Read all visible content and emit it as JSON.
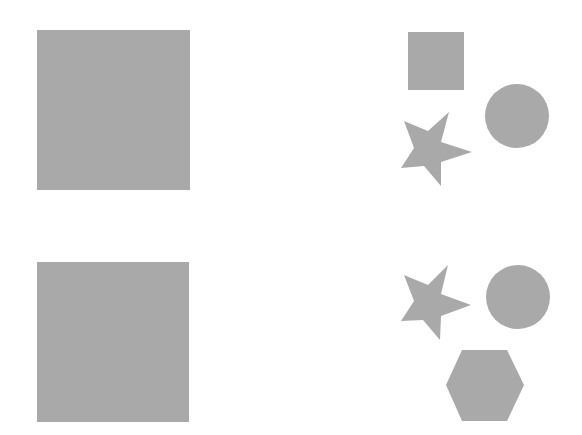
{
  "colors": {
    "background": "#ffffff",
    "fill": "#a9a9a9"
  },
  "rows": [
    {
      "left": {
        "shape": "square",
        "label": "large square"
      },
      "right": [
        {
          "shape": "square",
          "label": "small square"
        },
        {
          "shape": "circle",
          "label": "circle"
        },
        {
          "shape": "star",
          "label": "star"
        }
      ]
    },
    {
      "left": {
        "shape": "square",
        "label": "large square"
      },
      "right": [
        {
          "shape": "star",
          "label": "star"
        },
        {
          "shape": "circle",
          "label": "circle"
        },
        {
          "shape": "hexagon",
          "label": "hexagon"
        }
      ]
    }
  ]
}
